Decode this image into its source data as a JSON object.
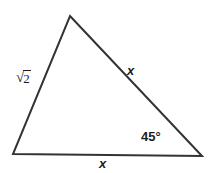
{
  "figure": {
    "type": "geometry-diagram",
    "shape": "triangle",
    "background_color": "#ffffff",
    "stroke_color": "#333333",
    "stroke_width": 2,
    "width": 213,
    "height": 173,
    "vertices": {
      "apex": {
        "x": 70,
        "y": 16
      },
      "bottom_left": {
        "x": 13,
        "y": 154
      },
      "bottom_right": {
        "x": 202,
        "y": 156
      }
    },
    "labels": {
      "left_side": {
        "text": "√2",
        "radical_sign": "√",
        "radicand": "2",
        "meaning": "square-root-of-two"
      },
      "right_side": {
        "text": "x"
      },
      "bottom_side": {
        "text": "x"
      },
      "angle_bottom_right": {
        "text": "45°",
        "value": 45,
        "unit": "degrees"
      }
    }
  }
}
